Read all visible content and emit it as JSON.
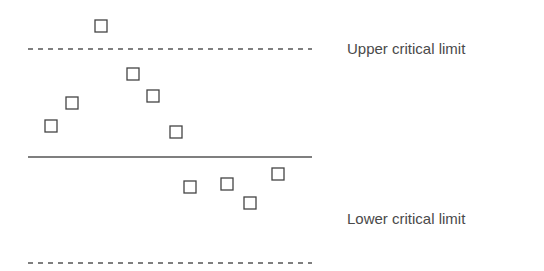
{
  "chart_data": {
    "type": "scatter",
    "title": "",
    "xlabel": "",
    "ylabel": "",
    "grid": false,
    "marker": "open-square",
    "reference_lines": [
      {
        "name": "Upper critical limit",
        "style": "dashed",
        "y_px": 49
      },
      {
        "name": "Center line",
        "style": "solid",
        "y_px": 157
      },
      {
        "name": "Lower critical limit",
        "style": "dashed",
        "y_px": 263
      }
    ],
    "points_px": [
      {
        "x": 51,
        "y": 126
      },
      {
        "x": 72,
        "y": 103
      },
      {
        "x": 101,
        "y": 26
      },
      {
        "x": 133,
        "y": 74
      },
      {
        "x": 153,
        "y": 96
      },
      {
        "x": 176,
        "y": 132
      },
      {
        "x": 190,
        "y": 187
      },
      {
        "x": 227,
        "y": 184
      },
      {
        "x": 250,
        "y": 203
      },
      {
        "x": 278,
        "y": 174
      }
    ],
    "annotations": [
      "Upper critical limit",
      "Lower critical limit"
    ]
  },
  "labels": {
    "upper": "Upper critical limit",
    "lower": "Lower critical limit"
  },
  "style": {
    "line_color": "#555555",
    "marker_color": "#444444"
  }
}
